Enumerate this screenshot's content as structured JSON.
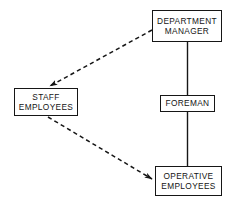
{
  "diagram": {
    "background_color": "#ffffff",
    "line_color": "#161616",
    "text_color": "#141414",
    "nodes": [
      {
        "id": "department-manager",
        "lines": [
          "DEPARTMENT",
          "MANAGER"
        ],
        "x": 152,
        "y": 10,
        "width": 70,
        "height": 32
      },
      {
        "id": "staff-employees",
        "lines": [
          "STAFF",
          "EMPLOYEES"
        ],
        "x": 14,
        "y": 88,
        "width": 64,
        "height": 28
      },
      {
        "id": "foreman",
        "lines": [
          "FOREMAN"
        ],
        "x": 160,
        "y": 95,
        "width": 55,
        "height": 17
      },
      {
        "id": "operative-employees",
        "lines": [
          "OPERATIVE",
          "EMPLOYEES"
        ],
        "x": 155,
        "y": 166,
        "width": 67,
        "height": 30
      }
    ],
    "connectors": [
      {
        "id": "manager-to-foreman",
        "style": "solid",
        "from": "department-manager",
        "to": "foreman",
        "x1": 187.5,
        "y1": 42,
        "x2": 187.5,
        "y2": 95,
        "arrow": false
      },
      {
        "id": "foreman-to-operative",
        "style": "solid",
        "from": "foreman",
        "to": "operative-employees",
        "x1": 187.5,
        "y1": 112,
        "x2": 187.5,
        "y2": 166,
        "arrow": false
      },
      {
        "id": "manager-to-staff",
        "style": "dashed",
        "from": "department-manager",
        "to": "staff-employees",
        "x1": 152,
        "y1": 30,
        "x2": 48,
        "y2": 87,
        "arrow": true
      },
      {
        "id": "staff-to-operative",
        "style": "dashed",
        "from": "staff-employees",
        "to": "operative-employees",
        "x1": 48,
        "y1": 117,
        "x2": 154,
        "y2": 180,
        "arrow": true
      }
    ]
  }
}
